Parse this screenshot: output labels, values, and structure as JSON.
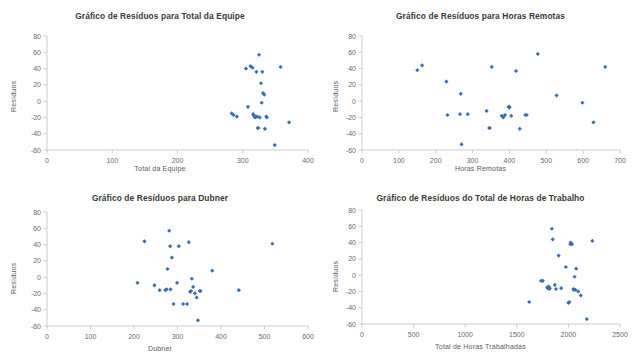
{
  "page": {
    "background": "#ffffff",
    "marker_color": "#3a6fb5",
    "axis_color": "#bfbfbf",
    "text_color": "#404040"
  },
  "charts": [
    {
      "id": "total-da-equipe",
      "type": "scatter",
      "title": "Gráfico de Resíduos para Total da Equipe",
      "xlabel": "Total da Equipe",
      "ylabel": "Resíduos",
      "xlim": [
        0,
        400
      ],
      "ylim": [
        -60,
        80
      ],
      "xticks": [
        0,
        100,
        200,
        300,
        400
      ],
      "yticks": [
        -60,
        -40,
        -20,
        0,
        20,
        40,
        60,
        80
      ],
      "grid": false,
      "legend": "none",
      "x": [
        283,
        286,
        291,
        305,
        308,
        312,
        315,
        316,
        317,
        318,
        319,
        320,
        321,
        322,
        323,
        324,
        325,
        326,
        328,
        329,
        330,
        331,
        333,
        334,
        336,
        337,
        349,
        358,
        371
      ],
      "y": [
        -15,
        -17,
        -19,
        40,
        -7,
        43,
        41,
        -16,
        -18,
        -19,
        -20,
        -19,
        36,
        -19,
        -33,
        -33,
        57,
        -20,
        22,
        -2,
        36,
        10,
        8,
        -34,
        -19,
        -20,
        -54,
        42,
        -26
      ]
    },
    {
      "id": "horas-remotas",
      "type": "scatter",
      "title": "Gráfico de Resíduos para Horas Remotas",
      "xlabel": "Horas Remotas",
      "ylabel": "Resíduos",
      "xlim": [
        0,
        700
      ],
      "ylim": [
        -60,
        80
      ],
      "xticks": [
        0,
        100,
        200,
        300,
        400,
        500,
        600,
        700
      ],
      "yticks": [
        -60,
        -40,
        -20,
        0,
        20,
        40,
        60,
        80
      ],
      "grid": false,
      "legend": "none",
      "x": [
        150,
        163,
        229,
        232,
        266,
        268,
        270,
        287,
        338,
        345,
        347,
        352,
        379,
        383,
        388,
        398,
        400,
        405,
        418,
        428,
        443,
        447,
        477,
        528,
        598,
        628,
        660,
        383,
        400
      ],
      "y": [
        38,
        44,
        24,
        -17,
        -16,
        9,
        -53,
        -16,
        -12,
        -33,
        -33,
        42,
        -18,
        -20,
        -17,
        -7,
        -7,
        -18,
        37,
        -34,
        -17,
        -17,
        58,
        7,
        -2,
        -26,
        42,
        -19,
        -8
      ]
    },
    {
      "id": "dubner",
      "type": "scatter",
      "title": "Gráfico de Resíduos para Dubner",
      "xlabel": "Dubner",
      "ylabel": "Resíduos",
      "xlim": [
        0,
        600
      ],
      "ylim": [
        -60,
        80
      ],
      "xticks": [
        0,
        100,
        200,
        300,
        400,
        500,
        600
      ],
      "yticks": [
        -60,
        -40,
        -20,
        0,
        20,
        40,
        60,
        80
      ],
      "grid": false,
      "legend": "none",
      "x": [
        208,
        224,
        247,
        259,
        272,
        275,
        277,
        281,
        283,
        287,
        291,
        299,
        303,
        313,
        322,
        326,
        329,
        331,
        333,
        336,
        340,
        344,
        347,
        351,
        353,
        380,
        441,
        518,
        284
      ],
      "y": [
        -7,
        44,
        -10,
        -16,
        -16,
        -15,
        10,
        57,
        38,
        24,
        -33,
        -7,
        38,
        -33,
        -33,
        43,
        -18,
        -17,
        -2,
        -12,
        -20,
        -25,
        -53,
        -17,
        -17,
        8,
        -16,
        41,
        -15
      ]
    },
    {
      "id": "total-horas-trabalho",
      "type": "scatter",
      "title": "Gráfico de Resíduos do Total de Horas de Trabalho",
      "xlabel": "Total de Horas Trabalhadas",
      "ylabel": "Resíduos",
      "xlim": [
        0,
        2500
      ],
      "ylim": [
        -60,
        80
      ],
      "xticks": [
        0,
        500,
        1000,
        1500,
        2000,
        2500
      ],
      "yticks": [
        -60,
        -40,
        -20,
        0,
        20,
        40,
        60,
        80
      ],
      "grid": false,
      "legend": "none",
      "x": [
        1620,
        1735,
        1752,
        1795,
        1800,
        1808,
        1815,
        1820,
        1840,
        1848,
        1868,
        1880,
        1905,
        1930,
        1975,
        2000,
        2010,
        2018,
        2022,
        2035,
        2048,
        2052,
        2060,
        2068,
        2075,
        2095,
        2120,
        2178,
        2232
      ],
      "y": [
        -33,
        -7,
        -7,
        -15,
        -16,
        -14,
        -17,
        -16,
        57,
        44,
        -12,
        -17,
        24,
        -16,
        10,
        -34,
        -33,
        38,
        40,
        38,
        -17,
        -18,
        -2,
        -18,
        8,
        -20,
        -25,
        -54,
        42
      ]
    }
  ]
}
